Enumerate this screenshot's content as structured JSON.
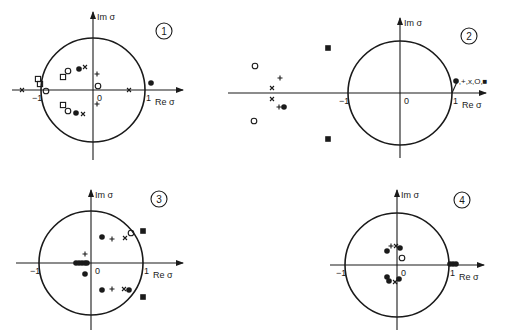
{
  "figure": {
    "axis_labels": {
      "x": "Re σ",
      "y": "Im σ"
    },
    "tick_labels": {
      "neg_one": "−1",
      "one": "1",
      "origin": "0"
    },
    "marker_legend": {
      "filled_circle": "●",
      "plus": "+",
      "cross": "x",
      "open_circle": "O",
      "open_square": "□",
      "filled_square": "■"
    }
  },
  "panels": [
    {
      "id": 1,
      "badge": "1",
      "center": [
        93,
        90
      ],
      "radius": 52,
      "xaxis": [
        12,
        183
      ],
      "yaxis": [
        12,
        160
      ],
      "badge_pos": [
        164,
        31
      ],
      "markers": [
        {
          "t": "square_open",
          "x": 38,
          "y": 79
        },
        {
          "t": "square_open",
          "x": 40,
          "y": 84
        },
        {
          "t": "circle_open",
          "x": 46,
          "y": 91
        },
        {
          "t": "cross",
          "x": 22,
          "y": 90
        },
        {
          "t": "square_open",
          "x": 63,
          "y": 77
        },
        {
          "t": "circle_open",
          "x": 68,
          "y": 71
        },
        {
          "t": "circle_filled",
          "x": 79,
          "y": 69
        },
        {
          "t": "cross",
          "x": 85,
          "y": 67
        },
        {
          "t": "plus",
          "x": 97,
          "y": 74
        },
        {
          "t": "circle_open",
          "x": 98,
          "y": 86
        },
        {
          "t": "cross",
          "x": 129,
          "y": 90
        },
        {
          "t": "circle_filled",
          "x": 151,
          "y": 83
        },
        {
          "t": "square_open",
          "x": 63,
          "y": 105
        },
        {
          "t": "circle_open",
          "x": 68,
          "y": 111
        },
        {
          "t": "circle_filled",
          "x": 76,
          "y": 113
        },
        {
          "t": "cross",
          "x": 83,
          "y": 114
        },
        {
          "t": "plus",
          "x": 97,
          "y": 104
        }
      ]
    },
    {
      "id": 2,
      "badge": "2",
      "center": [
        400,
        93
      ],
      "radius": 52,
      "xaxis": [
        228,
        486
      ],
      "yaxis": [
        18,
        158
      ],
      "badge_pos": [
        469,
        36
      ],
      "annotation": "●,+,x,O,■",
      "markers": [
        {
          "t": "square_filled",
          "x": 328,
          "y": 48
        },
        {
          "t": "circle_open",
          "x": 255,
          "y": 66
        },
        {
          "t": "plus",
          "x": 280,
          "y": 78
        },
        {
          "t": "cross",
          "x": 272,
          "y": 88
        },
        {
          "t": "cross",
          "x": 272,
          "y": 99
        },
        {
          "t": "plus",
          "x": 279,
          "y": 107
        },
        {
          "t": "circle_filled",
          "x": 284,
          "y": 107
        },
        {
          "t": "circle_open",
          "x": 254,
          "y": 121
        },
        {
          "t": "square_filled",
          "x": 328,
          "y": 139
        },
        {
          "t": "circle_filled",
          "x": 456,
          "y": 81
        }
      ]
    },
    {
      "id": 3,
      "badge": "3",
      "center": [
        91,
        263
      ],
      "radius": 52,
      "xaxis": [
        16,
        183
      ],
      "yaxis": [
        190,
        330
      ],
      "badge_pos": [
        159,
        199
      ],
      "markers": [
        {
          "t": "circle_filled",
          "x": 102,
          "y": 237
        },
        {
          "t": "plus",
          "x": 112,
          "y": 239
        },
        {
          "t": "cross",
          "x": 125,
          "y": 238
        },
        {
          "t": "circle_open",
          "x": 131,
          "y": 233
        },
        {
          "t": "square_filled",
          "x": 143,
          "y": 231
        },
        {
          "t": "plus",
          "x": 85,
          "y": 254
        },
        {
          "t": "circle_filled",
          "x": 76,
          "y": 263
        },
        {
          "t": "circle_filled",
          "x": 79,
          "y": 263
        },
        {
          "t": "circle_filled",
          "x": 82,
          "y": 263
        },
        {
          "t": "circle_filled",
          "x": 85,
          "y": 263
        },
        {
          "t": "circle_filled",
          "x": 87,
          "y": 263
        },
        {
          "t": "circle_filled",
          "x": 85,
          "y": 274
        },
        {
          "t": "circle_filled",
          "x": 102,
          "y": 290
        },
        {
          "t": "plus",
          "x": 112,
          "y": 289
        },
        {
          "t": "cross",
          "x": 124,
          "y": 289
        },
        {
          "t": "circle_filled",
          "x": 129,
          "y": 290
        },
        {
          "t": "square_filled",
          "x": 143,
          "y": 297
        }
      ]
    },
    {
      "id": 4,
      "badge": "4",
      "center": [
        397,
        265
      ],
      "radius": 52,
      "xaxis": [
        330,
        484
      ],
      "yaxis": [
        190,
        330
      ],
      "badge_pos": [
        462,
        200
      ],
      "markers": [
        {
          "t": "circle_filled",
          "x": 387,
          "y": 251
        },
        {
          "t": "plus",
          "x": 391,
          "y": 246
        },
        {
          "t": "cross",
          "x": 396,
          "y": 246
        },
        {
          "t": "circle_filled",
          "x": 400,
          "y": 248
        },
        {
          "t": "circle_open",
          "x": 402,
          "y": 258
        },
        {
          "t": "circle_filled",
          "x": 387,
          "y": 277
        },
        {
          "t": "circle_filled",
          "x": 389,
          "y": 281
        },
        {
          "t": "cross",
          "x": 395,
          "y": 282
        },
        {
          "t": "circle_filled",
          "x": 399,
          "y": 279
        },
        {
          "t": "circle_filled",
          "x": 450,
          "y": 264
        },
        {
          "t": "circle_filled",
          "x": 453,
          "y": 264
        },
        {
          "t": "circle_filled",
          "x": 456,
          "y": 264
        }
      ]
    }
  ]
}
